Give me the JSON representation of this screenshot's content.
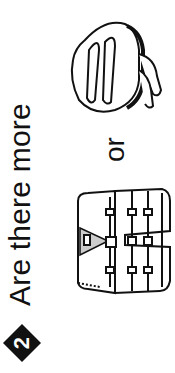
{
  "problem": {
    "number": "2",
    "question": "Are there more",
    "conjunction": "or",
    "options": [
      {
        "name": "life vest",
        "icon": "life-vest-icon"
      },
      {
        "name": "bike helmet",
        "icon": "bike-helmet-icon"
      }
    ]
  },
  "colors": {
    "ink": "#111111",
    "background": "#ffffff"
  }
}
